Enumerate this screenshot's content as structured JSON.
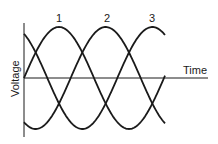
{
  "diagram": {
    "axes": {
      "ylabel": "Voltage",
      "xlabel": "Time"
    },
    "phases": [
      {
        "label": "1",
        "phase_deg": 0
      },
      {
        "label": "2",
        "phase_deg": 120
      },
      {
        "label": "3",
        "phase_deg": 240
      }
    ],
    "colors": {
      "line": "#1a1a1a",
      "background": "#ffffff"
    }
  }
}
